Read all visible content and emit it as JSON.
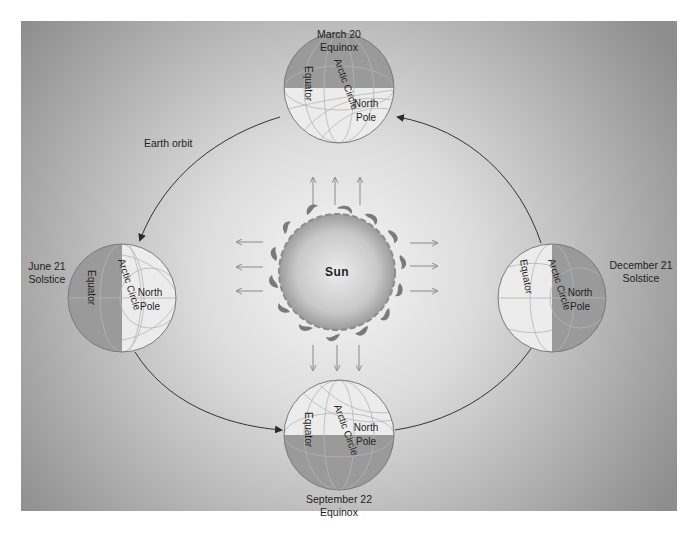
{
  "figure": {
    "colors": {
      "panel_edge": "#8f8f8f",
      "panel_center": "#f4f4f4",
      "dark_hemisphere": "#9a9a9a",
      "light_hemisphere": "#ececec",
      "orbit_line": "#333333",
      "ray_arrow": "#8a8a8a",
      "sun_core": "#c8c8c8",
      "sun_flame": "#7a7a7a"
    },
    "sun": {
      "label": "Sun"
    },
    "orbit": {
      "label": "Earth orbit"
    },
    "positions": [
      {
        "id": "march",
        "date": "March 20",
        "event": "Equinox"
      },
      {
        "id": "june",
        "date": "June 21",
        "event": "Solstice"
      },
      {
        "id": "september",
        "date": "September 22",
        "event": "Equinox"
      },
      {
        "id": "december",
        "date": "December 21",
        "event": "Solstice"
      }
    ],
    "globe_labels": {
      "equator": "Equator",
      "arctic_circle": "Arctic Circle",
      "north": "North",
      "pole": "Pole"
    }
  }
}
